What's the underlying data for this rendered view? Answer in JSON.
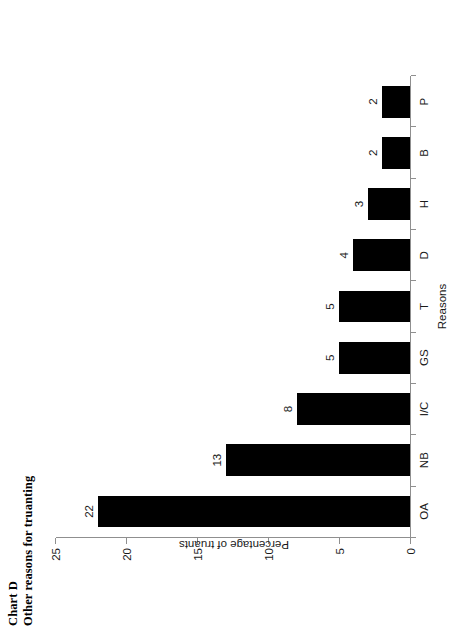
{
  "page": {
    "background_color": "#ffffff",
    "orientation": "rotated-90-ccw"
  },
  "title": {
    "line1": "Chart D",
    "line2": "Other reasons for truanting"
  },
  "chart_data": {
    "type": "bar",
    "orientation": "vertical",
    "categories": [
      "OA",
      "NB",
      "I/C",
      "GS",
      "T",
      "D",
      "H",
      "B",
      "P"
    ],
    "values": [
      22,
      13,
      8,
      5,
      5,
      4,
      3,
      2,
      2
    ],
    "data_labels": [
      "22",
      "13",
      "8",
      "5",
      "5",
      "4",
      "3",
      "2",
      "2"
    ],
    "xlabel": "Reasons",
    "ylabel": "Percentage of truants",
    "ylim": [
      0,
      25
    ],
    "ytick_values": [
      0,
      5,
      10,
      15,
      20,
      25
    ],
    "ytick_labels": [
      "0",
      "5",
      "10",
      "15",
      "20",
      "25"
    ],
    "grid": false,
    "legend": false,
    "bar_color": "#000000",
    "axis_color": "#8f8f8f"
  }
}
